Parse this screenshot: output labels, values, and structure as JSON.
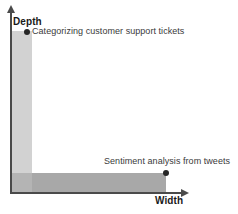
{
  "diagram": {
    "axes": {
      "y": {
        "label": "Depth",
        "arrow": "arrow-up-icon"
      },
      "x": {
        "label": "Width",
        "arrow": "arrow-right-icon"
      }
    },
    "points": [
      {
        "id": "categorizing-customer-support-tickets",
        "label": "Categorizing customer support tickets",
        "marker": "filled-circle-marker",
        "position": "high-depth-low-width"
      },
      {
        "id": "sentiment-analysis-from-tweets",
        "label": "Sentiment analysis from tweets",
        "marker": "filled-circle-marker",
        "position": "low-depth-high-width"
      }
    ],
    "regions": [
      {
        "id": "depth-band",
        "orientation": "vertical",
        "color": "#d2d2d2"
      },
      {
        "id": "width-band",
        "orientation": "horizontal",
        "color": "#a8a8a8"
      }
    ],
    "colors": {
      "axis": "#4a4a4a",
      "marker": "#262626",
      "label_text": "#3a3a3a",
      "axis_title_text": "#1a1a1a",
      "band_light": "#d2d2d2",
      "band_dark": "#a8a8a8"
    }
  }
}
